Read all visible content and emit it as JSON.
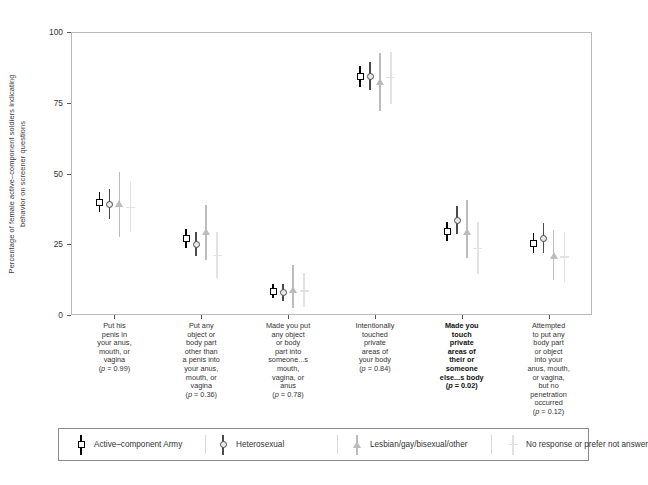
{
  "chart_data": {
    "type": "scatter",
    "title": "",
    "xlabel": "",
    "ylabel": "Percentage of female active–component soldiers indicating behavior on screener questions",
    "ylabel_line1": "Percentage of female active–component soldiers indicating",
    "ylabel_line2": "behavior on screener questions",
    "ylim": [
      0,
      100
    ],
    "yticks": [
      0,
      25,
      50,
      75,
      100
    ],
    "ytick_labels": [
      "0",
      "25",
      "50",
      "75",
      "100"
    ],
    "grid": false,
    "legend_position": "bottom",
    "categories": [
      {
        "id": "put-his-penis",
        "lines": [
          "Put his",
          "penis in",
          "your anus,",
          "mouth, or",
          "vagina"
        ],
        "pvalue": "(p = 0.99)",
        "p_display_prefix": "(",
        "p_italic": "p",
        "p_rest": " = 0.99)",
        "bold": false
      },
      {
        "id": "put-any-object-other-than-penis",
        "lines": [
          "Put any",
          "object or",
          "body part",
          "other than",
          "a penis into",
          "your anus,",
          "mouth, or",
          "vagina"
        ],
        "pvalue": "(p = 0.36)",
        "p_display_prefix": "(",
        "p_italic": "p",
        "p_rest": " = 0.36)",
        "bold": false
      },
      {
        "id": "made-you-put-object",
        "lines": [
          "Made you put",
          "any object",
          "or body",
          "part into",
          "someone...s",
          "mouth,",
          "vagina, or",
          "anus"
        ],
        "pvalue": "(p = 0.78)",
        "p_display_prefix": "(",
        "p_italic": "p",
        "p_rest": " = 0.78)",
        "bold": false
      },
      {
        "id": "intentionally-touched",
        "lines": [
          "Intentionally",
          "touched",
          "private",
          "areas of",
          "your body"
        ],
        "pvalue": "(p = 0.84)",
        "p_display_prefix": "(",
        "p_italic": "p",
        "p_rest": " = 0.84)",
        "bold": false
      },
      {
        "id": "made-you-touch",
        "lines": [
          "Made you",
          "touch",
          "private",
          "areas of",
          "their or",
          "someone",
          "else...s body"
        ],
        "pvalue": "(p = 0.02)",
        "p_display_prefix": "(",
        "p_italic": "p",
        "p_rest": " = 0.02)",
        "bold": true
      },
      {
        "id": "attempted-to-put",
        "lines": [
          "Attempted",
          "to put any",
          "body part",
          "or object",
          "into your",
          "anus, mouth,",
          "or vagina,",
          "but no",
          "penetration",
          "occurred"
        ],
        "pvalue": "(p = 0.12)",
        "p_display_prefix": "(",
        "p_italic": "p",
        "p_rest": " = 0.12)",
        "bold": false
      }
    ],
    "series": [
      {
        "name": "Active–component Army",
        "marker": "square",
        "color": "#000000",
        "values": [
          40.0,
          27.0,
          8.5,
          84.5,
          29.5,
          25.5
        ],
        "lower": [
          36.5,
          23.5,
          6.0,
          80.5,
          26.0,
          22.0
        ],
        "upper": [
          43.5,
          30.5,
          11.0,
          88.0,
          33.0,
          29.0
        ]
      },
      {
        "name": "Heterosexual",
        "marker": "circle",
        "color": "#4a4a4a",
        "values": [
          39.0,
          25.0,
          8.0,
          84.5,
          33.5,
          27.0
        ],
        "lower": [
          34.0,
          21.0,
          5.0,
          79.5,
          28.5,
          22.0
        ],
        "upper": [
          44.5,
          29.5,
          11.0,
          89.5,
          38.5,
          32.5
        ]
      },
      {
        "name": "Lesbian/gay/bisexual/other",
        "marker": "triangle",
        "color": "#bcbcbc",
        "values": [
          39.5,
          29.5,
          9.0,
          82.5,
          29.5,
          21.0
        ],
        "lower": [
          27.5,
          19.5,
          2.5,
          72.0,
          20.0,
          12.5
        ],
        "upper": [
          50.5,
          39.0,
          17.5,
          92.5,
          40.5,
          30.0
        ]
      },
      {
        "name": "No response or prefer not answer",
        "marker": "plus",
        "color": "#e2e2e2",
        "values": [
          38.0,
          21.0,
          8.5,
          84.0,
          23.5,
          20.5
        ],
        "lower": [
          29.5,
          13.0,
          3.0,
          74.5,
          14.5,
          11.5
        ],
        "upper": [
          47.0,
          29.5,
          15.0,
          93.0,
          33.0,
          29.5
        ]
      }
    ]
  },
  "legend": {
    "entries": [
      {
        "label": "Active–component Army",
        "marker": "square",
        "color": "#000000"
      },
      {
        "label": "Heterosexual",
        "marker": "circle",
        "color": "#4a4a4a"
      },
      {
        "label": "Lesbian/gay/bisexual/other",
        "marker": "triangle",
        "color": "#bcbcbc"
      },
      {
        "label": "No response or prefer not answer",
        "marker": "plus",
        "color": "#e2e2e2"
      }
    ]
  }
}
